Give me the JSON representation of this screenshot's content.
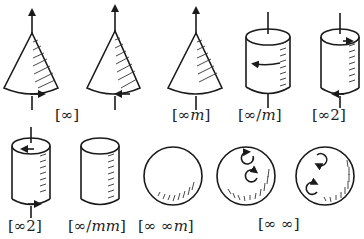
{
  "figure": {
    "colors": {
      "ink": "#1a1a1a",
      "background": "#ffffff"
    },
    "rows": [
      {
        "items": [
          {
            "shape": "cone",
            "variant": "rotating-arrow-right",
            "label": null
          },
          {
            "shape": "cone",
            "variant": "rotating-arrow-left",
            "label": "[∞]"
          },
          {
            "shape": "cone",
            "variant": "plain",
            "label": "[∞m]"
          },
          {
            "shape": "cylinder",
            "variant": "rotating-arrow-middle",
            "label": "[∞/m]"
          },
          {
            "shape": "cylinder",
            "variant": "arrows-top-bottom",
            "label": "[∞2]"
          }
        ]
      },
      {
        "items": [
          {
            "shape": "cylinder",
            "variant": "arrows-top-bottom-axis",
            "label": "[∞2]"
          },
          {
            "shape": "cylinder",
            "variant": "plain",
            "label": "[∞/mm]"
          },
          {
            "shape": "sphere",
            "variant": "plain",
            "label": "[∞∞m]"
          },
          {
            "shape": "sphere",
            "variant": "two-rotations",
            "label": null
          },
          {
            "shape": "sphere",
            "variant": "two-rotations-mirrored",
            "label": "[∞∞]"
          }
        ]
      }
    ],
    "labels": {
      "cone_pair": {
        "prefix": "[",
        "sym": "∞",
        "suffix": "]"
      },
      "cone_m": {
        "prefix": "[",
        "sym": "∞",
        "italic": "m",
        "suffix": "]"
      },
      "cyl_over_m": {
        "prefix": "[",
        "sym": "∞/",
        "italic": "m",
        "suffix": "]"
      },
      "cyl_2_top": {
        "prefix": "[",
        "sym": "∞2",
        "suffix": "]"
      },
      "cyl_2_bottom": {
        "prefix": "[",
        "sym": "∞2",
        "suffix": "]"
      },
      "cyl_mm": {
        "prefix": "[",
        "sym": "∞/",
        "italic": "mm",
        "suffix": "]"
      },
      "sphere_m": {
        "prefix": "[",
        "sym": "∞ ∞",
        "italic": "m",
        "suffix": "]"
      },
      "sphere_pair": {
        "prefix": "[",
        "sym": "∞ ∞",
        "suffix": "]"
      }
    }
  }
}
